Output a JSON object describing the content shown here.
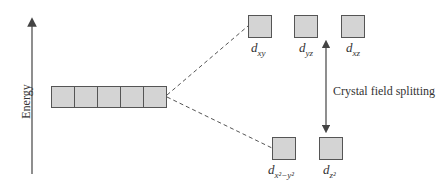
{
  "diagram": {
    "type": "crystal field splitting energy diagram",
    "axis": {
      "label": "Energy",
      "direction": "up"
    },
    "degenerate_set": {
      "count": 5,
      "description": "five degenerate d orbitals"
    },
    "upper_set": {
      "orbitals": [
        {
          "id": "dxy",
          "base": "d",
          "sub": "xy"
        },
        {
          "id": "dyz",
          "base": "d",
          "sub": "yz"
        },
        {
          "id": "dxz",
          "base": "d",
          "sub": "xz"
        }
      ]
    },
    "lower_set": {
      "orbitals": [
        {
          "id": "dx2-y2",
          "base": "d",
          "sub_html": "x²−y²"
        },
        {
          "id": "dz2",
          "base": "d",
          "sub_html": "z²"
        }
      ]
    },
    "splitting_label": "Crystal field splitting",
    "colors": {
      "box_fill": "#d4d4d4",
      "box_border": "#555555",
      "line": "#444444"
    }
  }
}
